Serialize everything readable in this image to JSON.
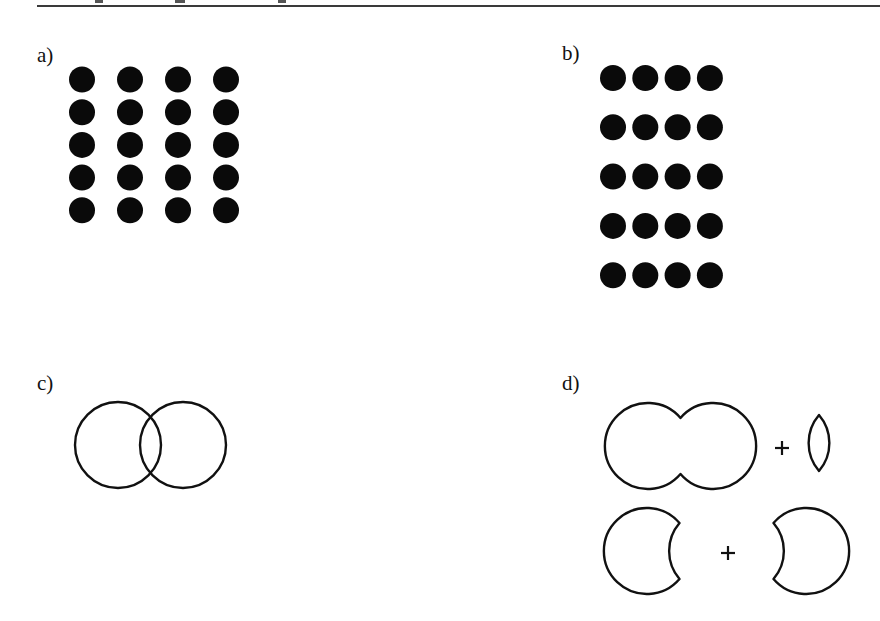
{
  "figure": {
    "header_text_cropped": "",
    "panels": [
      {
        "id": "a",
        "label": "a)",
        "kind": "dot-grid",
        "description": "Dots evenly spaced: proximity grouping ambiguous / grouped by columns",
        "columns": 4,
        "rows": 5,
        "dot_color": "#0a0a0a"
      },
      {
        "id": "b",
        "label": "b)",
        "kind": "dot-grid",
        "description": "Dots close horizontally, spaced vertically: grouped into rows",
        "columns": 4,
        "rows": 5,
        "dot_color": "#0a0a0a"
      },
      {
        "id": "c",
        "label": "c)",
        "kind": "overlapping-circles",
        "description": "Two overlapping circle outlines",
        "circle_count": 2
      },
      {
        "id": "d",
        "label": "d)",
        "kind": "decompositions",
        "description": "Alternative decompositions of the overlapping circles",
        "rows": [
          {
            "parts": [
              "union-outline",
              "lens"
            ],
            "operator": "+"
          },
          {
            "parts": [
              "left-crescent",
              "right-crescent"
            ],
            "operator": "+"
          }
        ]
      }
    ],
    "stroke_color": "#111111"
  }
}
